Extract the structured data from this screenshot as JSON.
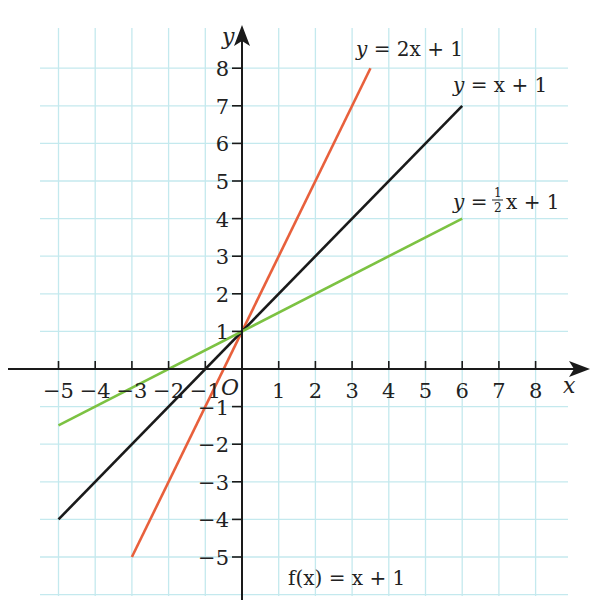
{
  "chart_data": {
    "type": "line",
    "title": "f(x) = x + 1",
    "xlabel": "x",
    "ylabel": "y",
    "origin_label": "O",
    "xlim": [
      -5.5,
      8.9
    ],
    "ylim": [
      -6.1,
      9.0
    ],
    "grid": true,
    "x_ticks": [
      -5,
      -4,
      -3,
      -2,
      -1,
      1,
      2,
      3,
      4,
      5,
      6,
      7,
      8
    ],
    "y_ticks": [
      -5,
      -4,
      -3,
      -2,
      -1,
      1,
      2,
      3,
      4,
      5,
      6,
      7,
      8
    ],
    "series": [
      {
        "name": "y = 2x + 1",
        "equation": "y = 2x + 1",
        "slope": 2,
        "intercept": 1,
        "x": [
          -3,
          3.5
        ],
        "y": [
          -5,
          8
        ],
        "color": "#e8603c"
      },
      {
        "name": "y = x + 1",
        "equation": "y = x + 1",
        "slope": 1,
        "intercept": 1,
        "x": [
          -5,
          6
        ],
        "y": [
          -4,
          7
        ],
        "color": "#1a1a1a"
      },
      {
        "name": "y = ½x + 1",
        "equation": "y = 1/2 x + 1",
        "slope": 0.5,
        "intercept": 1,
        "x": [
          -5,
          6
        ],
        "y": [
          -1.5,
          4
        ],
        "color": "#7cc242"
      }
    ]
  },
  "labels": {
    "y_axis": "y",
    "x_axis": "x",
    "origin": "O",
    "caption": "f(x) = x + 1",
    "eq_red_pre": "y",
    "eq_red_post": " = 2x + 1",
    "eq_black_pre": "y",
    "eq_black_post": " = x + 1",
    "eq_green_pre": "y",
    "eq_green_mid": " =",
    "eq_green_num": "1",
    "eq_green_den": "2",
    "eq_green_post": "x + 1"
  },
  "colors": {
    "grid": "#c4e9ee",
    "axis": "#1a1a1a",
    "red": "#e8603c",
    "black": "#1a1a1a",
    "green": "#7cc242"
  }
}
